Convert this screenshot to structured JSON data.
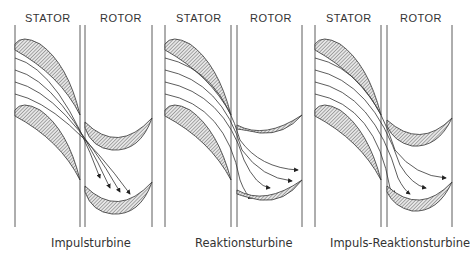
{
  "panels": [
    {
      "stator_label": "STATOR",
      "rotor_label": "ROTOR",
      "caption": "Impulsturbine"
    },
    {
      "stator_label": "STATOR",
      "rotor_label": "ROTOR",
      "caption": "Reaktionsturbine"
    },
    {
      "stator_label": "STATOR",
      "rotor_label": "ROTOR",
      "caption": "Impuls-Reaktionsturbine"
    }
  ],
  "colors": {
    "line": "#333333",
    "hatch": "#555555",
    "background": "#ffffff"
  }
}
